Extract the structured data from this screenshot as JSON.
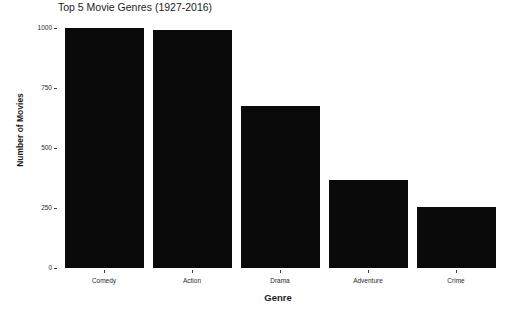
{
  "chart_data": {
    "type": "bar",
    "title": "Top 5 Movie Genres (1927-2016)",
    "xlabel": "Genre",
    "ylabel": "Number of Movies",
    "categories": [
      "Comedy",
      "Action",
      "Drama",
      "Adventure",
      "Crime"
    ],
    "values": [
      1000,
      990,
      675,
      365,
      255
    ],
    "ylim": [
      0,
      1000
    ],
    "yticks": [
      0,
      250,
      500,
      750,
      1000
    ],
    "ytick_labels": [
      "0",
      "250",
      "500",
      "750",
      "1000"
    ],
    "grid": false,
    "legend": null,
    "bar_color": "#0a0a0a",
    "background_color": "#ffffff"
  }
}
